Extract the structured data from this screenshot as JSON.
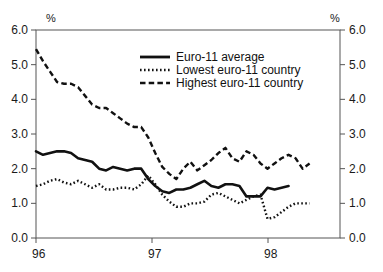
{
  "chart_data": {
    "type": "line",
    "title": "",
    "subtitle": "",
    "xlabel": "",
    "ylabel": "",
    "left_axis_unit": "%",
    "right_axis_unit": "%",
    "ylim": [
      0.0,
      6.0
    ],
    "yticks": [
      0.0,
      1.0,
      2.0,
      3.0,
      4.0,
      5.0,
      6.0
    ],
    "ytick_labels": [
      "0.0",
      "1.0",
      "2.0",
      "3.0",
      "4.0",
      "5.0",
      "6.0"
    ],
    "right_ytick_labels": [
      "0.0",
      "1.0",
      "2.0",
      "3.0",
      "4.0",
      "5.0",
      "6.0"
    ],
    "xticks": [
      0,
      12,
      24
    ],
    "xtick_labels": [
      "96",
      "97",
      "98"
    ],
    "grid": false,
    "legend_position": "top-center",
    "dual_axis": true,
    "x": [
      0,
      1,
      2,
      3,
      4,
      5,
      6,
      7,
      8,
      9,
      10,
      11,
      12,
      13,
      14,
      15,
      16,
      17,
      18,
      19,
      20,
      21,
      22,
      23,
      24,
      25,
      26,
      27,
      28,
      29,
      30,
      31,
      32
    ],
    "series": [
      {
        "name": "Euro-11 average",
        "style": "solid",
        "color": "#111111",
        "values": [
          2.5,
          2.4,
          2.45,
          2.5,
          2.5,
          2.45,
          2.3,
          2.25,
          2.2,
          2.0,
          1.95,
          2.05,
          2.0,
          1.95,
          2.0,
          2.0,
          1.7,
          1.5,
          1.35,
          1.3,
          1.4,
          1.4,
          1.45,
          1.55,
          1.65,
          1.5,
          1.45,
          1.55,
          1.55,
          1.5,
          1.2,
          1.2,
          1.2
        ]
      },
      {
        "name": "Lowest euro-11 country",
        "style": "dotted",
        "color": "#111111",
        "values": [
          1.5,
          1.55,
          1.65,
          1.7,
          1.6,
          1.55,
          1.65,
          1.55,
          1.45,
          1.55,
          1.4,
          1.4,
          1.45,
          1.45,
          1.4,
          1.55,
          1.8,
          1.55,
          1.25,
          1.05,
          0.9,
          0.9,
          1.0,
          1.0,
          1.05,
          1.25,
          1.3,
          1.2,
          1.1,
          1.0,
          1.1,
          1.2,
          1.25
        ]
      },
      {
        "name": "Highest euro-11 country",
        "style": "dashed",
        "color": "#111111",
        "values": [
          5.45,
          5.1,
          4.8,
          4.5,
          4.45,
          4.45,
          4.35,
          4.1,
          3.85,
          3.75,
          3.75,
          3.6,
          3.45,
          3.3,
          3.2,
          3.2,
          2.9,
          2.45,
          2.05,
          1.85,
          1.7,
          2.0,
          2.2,
          1.95,
          2.1,
          2.25,
          2.45,
          2.6,
          2.3,
          2.2,
          2.5,
          2.4,
          2.15
        ]
      }
    ],
    "series_tail": {
      "Euro-11 average": [
        1.45,
        1.4,
        1.45,
        1.5
      ],
      "Lowest euro-11 country": [
        0.55,
        0.6,
        0.75,
        0.9,
        1.0,
        1.0,
        1.0
      ],
      "Highest euro-11 country": [
        2.0,
        2.15,
        2.3,
        2.4,
        2.3,
        2.0,
        2.15
      ]
    }
  },
  "legend": {
    "items": [
      {
        "label": "Euro-11 average",
        "style": "solid"
      },
      {
        "label": "Lowest euro-11 country",
        "style": "dotted"
      },
      {
        "label": "Highest euro-11 country",
        "style": "dashed"
      }
    ]
  },
  "axes": {
    "left_unit": "%",
    "right_unit": "%"
  }
}
